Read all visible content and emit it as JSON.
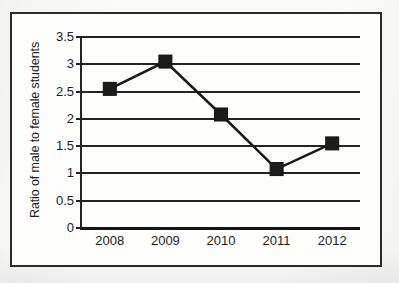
{
  "figure": {
    "frame_color": "#2b2b2b",
    "background_color": "#fdfdfc",
    "line_color": "#1a1a1a",
    "marker_color": "#1c1c1c",
    "grid_color": "#232323"
  },
  "chart_data": {
    "type": "line",
    "title": "",
    "xlabel": "",
    "ylabel": "Ratio of male to female students",
    "categories": [
      "2008",
      "2009",
      "2010",
      "2011",
      "2012"
    ],
    "values": [
      2.55,
      3.05,
      2.08,
      1.08,
      1.55
    ],
    "series": [
      {
        "name": "Ratio of male to female students",
        "values": [
          2.55,
          3.05,
          2.08,
          1.08,
          1.55
        ]
      }
    ],
    "ylim": [
      0,
      3.5
    ],
    "yticks": [
      "0",
      "0.5",
      "1",
      "1.5",
      "2",
      "2.5",
      "3",
      "3.5"
    ],
    "ytick_values": [
      0,
      0.5,
      1,
      1.5,
      2,
      2.5,
      3,
      3.5
    ],
    "xticks": [
      "2008",
      "2009",
      "2010",
      "2011",
      "2012"
    ],
    "grid": true,
    "grid_axis": "y",
    "legend": false,
    "legend_position": "none",
    "marker": "square",
    "annotations": []
  }
}
